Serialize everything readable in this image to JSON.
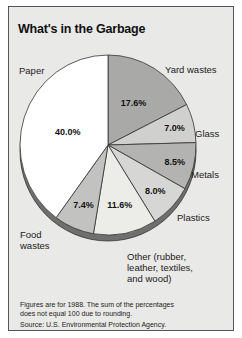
{
  "chart_data": {
    "type": "pie",
    "title": "What's in the Garbage",
    "slices": [
      {
        "name": "Yard wastes",
        "value": 17.6,
        "label": "17.6%",
        "color": "#a9a9a7"
      },
      {
        "name": "Glass",
        "value": 7.0,
        "label": "7.0%",
        "color": "#d0d0ce"
      },
      {
        "name": "Metals",
        "value": 8.5,
        "label": "8.5%",
        "color": "#b3b3b1"
      },
      {
        "name": "Plastics",
        "value": 8.0,
        "label": "8.0%",
        "color": "#d6d6d4"
      },
      {
        "name": "Other (rubber, leather, textiles, and wood)",
        "value": 11.6,
        "label": "11.6%",
        "color": "#ecece9"
      },
      {
        "name": "Food wastes",
        "value": 7.4,
        "label": "7.4%",
        "color": "#c2c2c0"
      },
      {
        "name": "Paper",
        "value": 40.0,
        "label": "40.0%",
        "color": "#ffffff"
      }
    ],
    "category_labels": {
      "paper": "Paper",
      "yard": "Yard wastes",
      "glass": "Glass",
      "metals": "Metals",
      "plastics": "Plastics",
      "other": [
        "Other (rubber,",
        "leather, textiles,",
        "and wood)"
      ],
      "food": [
        "Food",
        "wastes"
      ]
    }
  },
  "notes": {
    "line1": "Figures are for 1988. The sum of the percentages",
    "line2": "does not equal 100 due to rounding.",
    "source": "Source: U.S. Environmental Protection Agency."
  }
}
